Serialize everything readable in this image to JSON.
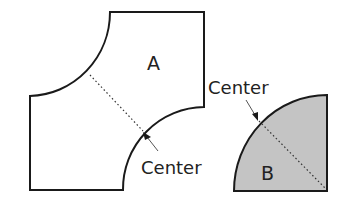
{
  "diagram": {
    "shape_a": {
      "label": "A",
      "fill": "#ffffff",
      "description": "Square with two opposite quarter-circle corners cut out (top-left and bottom-right)"
    },
    "shape_b": {
      "label": "B",
      "fill": "#c4c4c4",
      "description": "Quarter-circle shaded piece"
    },
    "annotations": [
      {
        "id": "center-a",
        "text": "Center"
      },
      {
        "id": "center-b",
        "text": "Center"
      }
    ],
    "colors": {
      "stroke": "#1a1a1a",
      "shade": "#c4c4c4",
      "background": "#ffffff"
    }
  }
}
